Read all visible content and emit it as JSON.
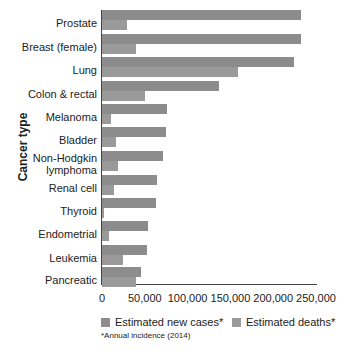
{
  "chart_data": {
    "type": "bar",
    "orientation": "horizontal",
    "title": "",
    "xlabel": "",
    "ylabel": "Cancer type",
    "xlim": [
      0,
      250000
    ],
    "xticks": [
      "0",
      "50,000",
      "100,000",
      "150,000",
      "200,000",
      "250,000"
    ],
    "categories": [
      "Prostate",
      "Breast (female)",
      "Lung",
      "Colon & rectal",
      "Melanoma",
      "Bladder",
      "Non-Hodgkin lymphoma",
      "Renal cell",
      "Thyroid",
      "Endometrial",
      "Leukemia",
      "Pancreatic"
    ],
    "series": [
      {
        "name": "Estimated new cases*",
        "color": "#8c8c8c",
        "values": [
          233000,
          232000,
          224000,
          137000,
          76000,
          75000,
          71000,
          64000,
          63000,
          54000,
          52000,
          46000
        ]
      },
      {
        "name": "Estimated deaths*",
        "color": "#9a9a9a",
        "values": [
          29000,
          40000,
          159000,
          50000,
          10000,
          16000,
          19000,
          14000,
          2000,
          8000,
          24000,
          40000
        ]
      }
    ],
    "legend_position": "bottom",
    "grid": false,
    "annotation": "*Annual incidence (2014)"
  }
}
